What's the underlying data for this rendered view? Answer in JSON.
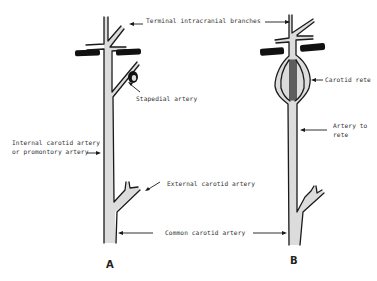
{
  "figure": {
    "panels": [
      {
        "id": "A",
        "label": "A",
        "annotations": {
          "terminal_branches": "Terminal intracranial branches",
          "stapedial_artery": "Stapedial artery",
          "internal_carotid_line1": "Internal carotid artery",
          "internal_carotid_line2": "or promontory artery",
          "external_carotid": "External carotid artery",
          "common_carotid": "Common carotid artery"
        }
      },
      {
        "id": "B",
        "label": "B",
        "annotations": {
          "carotid_rete": "Carotid rete",
          "artery_to_rete_line1": "Artery to",
          "artery_to_rete_line2": "rete"
        }
      }
    ],
    "colors": {
      "vessel_fill": "#dcdcdc",
      "outline": "#1a1a1a",
      "bone": "#111111",
      "background": "#ffffff"
    }
  }
}
